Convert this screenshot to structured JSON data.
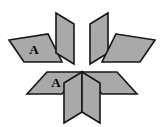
{
  "figure": {
    "name": "parallelogram-star-tiling",
    "background_color": "#ffffff",
    "width": 164,
    "height": 127,
    "center": {
      "x": 82,
      "y": 71
    },
    "style": {
      "fill_color": "#a9a9a9",
      "stroke_color": "#161616",
      "stroke_width": 1.6,
      "label_color": "#000000",
      "label_font_size": 13
    },
    "tiles": [
      {
        "id": "tile-upper-left-horizontal",
        "name": "upper-left-horizontal-parallelogram",
        "label": "A",
        "label_x": 34,
        "label_y": 49,
        "points": "9,40 48,34 62,62 24,62",
        "fill": "#a9a9a9"
      },
      {
        "id": "tile-upper-left-vertical",
        "name": "upper-left-vertical-parallelogram",
        "label": "",
        "label_x": 0,
        "label_y": 0,
        "points": "56,13 74,24 74,64 56,53",
        "fill": "#a9a9a9"
      },
      {
        "id": "tile-upper-right-vertical",
        "name": "upper-right-vertical-parallelogram",
        "label": "",
        "label_x": 0,
        "label_y": 0,
        "points": "108,13 108,53 90,64 90,24",
        "fill": "#a9a9a9"
      },
      {
        "id": "tile-upper-right-horizontal",
        "name": "upper-right-horizontal-parallelogram",
        "label": "",
        "label_x": 0,
        "label_y": 0,
        "points": "116,34 155,40 140,62 102,62",
        "fill": "#a9a9a9"
      },
      {
        "id": "tile-lower-left-horizontal",
        "name": "lower-left-horizontal-parallelogram",
        "label": "A",
        "label_x": 56,
        "label_y": 82,
        "points": "47,72 82,72 62,94 27,94",
        "fill": "#a9a9a9"
      },
      {
        "id": "tile-lower-right-horizontal",
        "name": "lower-right-horizontal-parallelogram",
        "label": "",
        "label_x": 0,
        "label_y": 0,
        "points": "82,72 117,72 137,94 102,94",
        "fill": "#a9a9a9"
      },
      {
        "id": "tile-lower-left-vertical",
        "name": "lower-left-vertical-parallelogram",
        "label": "",
        "label_x": 0,
        "label_y": 0,
        "points": "82,72 82,112 64,123 64,83",
        "fill": "#a9a9a9"
      },
      {
        "id": "tile-lower-right-vertical",
        "name": "lower-right-vertical-parallelogram",
        "label": "",
        "label_x": 0,
        "label_y": 0,
        "points": "82,72 100,83 100,123 82,112",
        "fill": "#a9a9a9"
      }
    ]
  }
}
